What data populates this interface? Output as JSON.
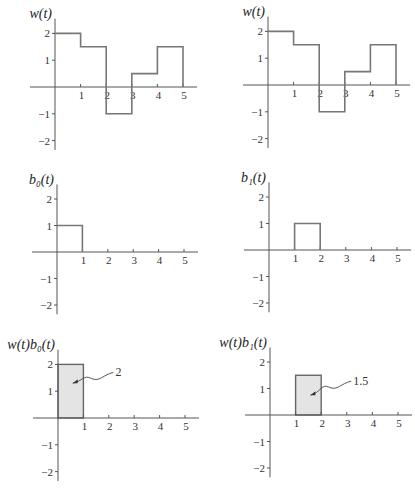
{
  "figure": {
    "panels": [
      {
        "id": "w",
        "title": "w(t)"
      },
      {
        "id": "w-copy",
        "title": "w(t)"
      },
      {
        "id": "b0",
        "title": "b₀(t)"
      },
      {
        "id": "b1",
        "title": "b₁(t)"
      },
      {
        "id": "wb0",
        "title": "w(t)b₀(t)",
        "annotation": "2"
      },
      {
        "id": "wb1",
        "title": "w(t)b₁(t)",
        "annotation": "1.5"
      }
    ],
    "x_ticks": [
      "1",
      "2",
      "3",
      "4",
      "5"
    ],
    "y_ticks": [
      "2",
      "1",
      "−1",
      "−2"
    ],
    "colors": {
      "line": "#777777",
      "axis": "#555555",
      "fill": "#e4e4e4"
    }
  },
  "chart_data": [
    {
      "type": "line",
      "subtype": "step",
      "title": "w(t)",
      "x": [
        0,
        1,
        2,
        3,
        4,
        5
      ],
      "values": [
        2,
        1.5,
        -1,
        0.5,
        1.5
      ],
      "segments": [
        [
          0,
          1,
          2
        ],
        [
          1,
          2,
          1.5
        ],
        [
          2,
          3,
          -1
        ],
        [
          3,
          4,
          0.5
        ],
        [
          4,
          5,
          1.5
        ]
      ],
      "xlabel": "",
      "ylabel": "w(t)",
      "xlim": [
        0,
        5.5
      ],
      "ylim": [
        -2.3,
        2.5
      ],
      "x_ticks": [
        1,
        2,
        3,
        4,
        5
      ],
      "y_ticks": [
        -2,
        -1,
        1,
        2
      ],
      "grid": false
    },
    {
      "type": "line",
      "subtype": "step",
      "title": "w(t)",
      "x": [
        0,
        1,
        2,
        3,
        4,
        5
      ],
      "values": [
        2,
        1.5,
        -1,
        0.5,
        1.5
      ],
      "segments": [
        [
          0,
          1,
          2
        ],
        [
          1,
          2,
          1.5
        ],
        [
          2,
          3,
          -1
        ],
        [
          3,
          4,
          0.5
        ],
        [
          4,
          5,
          1.5
        ]
      ],
      "xlabel": "",
      "ylabel": "w(t)",
      "xlim": [
        0,
        5.5
      ],
      "ylim": [
        -2.3,
        2.5
      ],
      "x_ticks": [
        1,
        2,
        3,
        4,
        5
      ],
      "y_ticks": [
        -2,
        -1,
        1,
        2
      ],
      "grid": false
    },
    {
      "type": "line",
      "subtype": "step",
      "title": "b0(t)",
      "segments": [
        [
          0,
          1,
          1
        ]
      ],
      "xlabel": "",
      "ylabel": "b0(t)",
      "xlim": [
        0,
        5.5
      ],
      "ylim": [
        -2.3,
        2.5
      ],
      "x_ticks": [
        1,
        2,
        3,
        4,
        5
      ],
      "y_ticks": [
        -2,
        -1,
        1,
        2
      ],
      "grid": false
    },
    {
      "type": "line",
      "subtype": "step",
      "title": "b1(t)",
      "segments": [
        [
          1,
          2,
          1
        ]
      ],
      "xlabel": "",
      "ylabel": "b1(t)",
      "xlim": [
        0,
        5.5
      ],
      "ylim": [
        -2.3,
        2.5
      ],
      "x_ticks": [
        1,
        2,
        3,
        4,
        5
      ],
      "y_ticks": [
        -2,
        -1,
        1,
        2
      ],
      "grid": false
    },
    {
      "type": "area",
      "title": "w(t)b0(t)",
      "segments": [
        [
          0,
          1,
          2
        ]
      ],
      "annotation": {
        "text": "2",
        "meaning": "shaded area"
      },
      "xlabel": "",
      "ylabel": "w(t)b0(t)",
      "xlim": [
        0,
        5.5
      ],
      "ylim": [
        -2.3,
        2.5
      ],
      "x_ticks": [
        1,
        2,
        3,
        4,
        5
      ],
      "y_ticks": [
        -2,
        -1,
        1,
        2
      ],
      "grid": false
    },
    {
      "type": "area",
      "title": "w(t)b1(t)",
      "segments": [
        [
          1,
          2,
          1.5
        ]
      ],
      "annotation": {
        "text": "1.5",
        "meaning": "shaded area"
      },
      "xlabel": "",
      "ylabel": "w(t)b1(t)",
      "xlim": [
        0,
        5.5
      ],
      "ylim": [
        -2.3,
        2.5
      ],
      "x_ticks": [
        1,
        2,
        3,
        4,
        5
      ],
      "y_ticks": [
        -2,
        -1,
        1,
        2
      ],
      "grid": false
    }
  ]
}
